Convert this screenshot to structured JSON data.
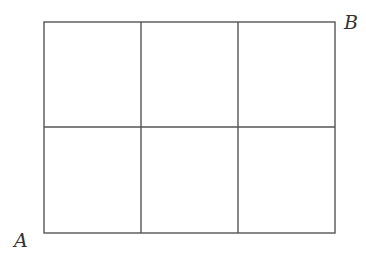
{
  "diagram": {
    "type": "grid",
    "rows": 2,
    "cols": 3,
    "stroke_color": "#555555",
    "bounds": {
      "left": 44,
      "top": 22,
      "right": 335,
      "bottom": 233
    },
    "column_lines_x": [
      44,
      141,
      238,
      335
    ],
    "row_lines_y": [
      22,
      127,
      233
    ],
    "points": [
      {
        "label": "A",
        "position": "bottom-left"
      },
      {
        "label": "B",
        "position": "top-right"
      }
    ]
  }
}
